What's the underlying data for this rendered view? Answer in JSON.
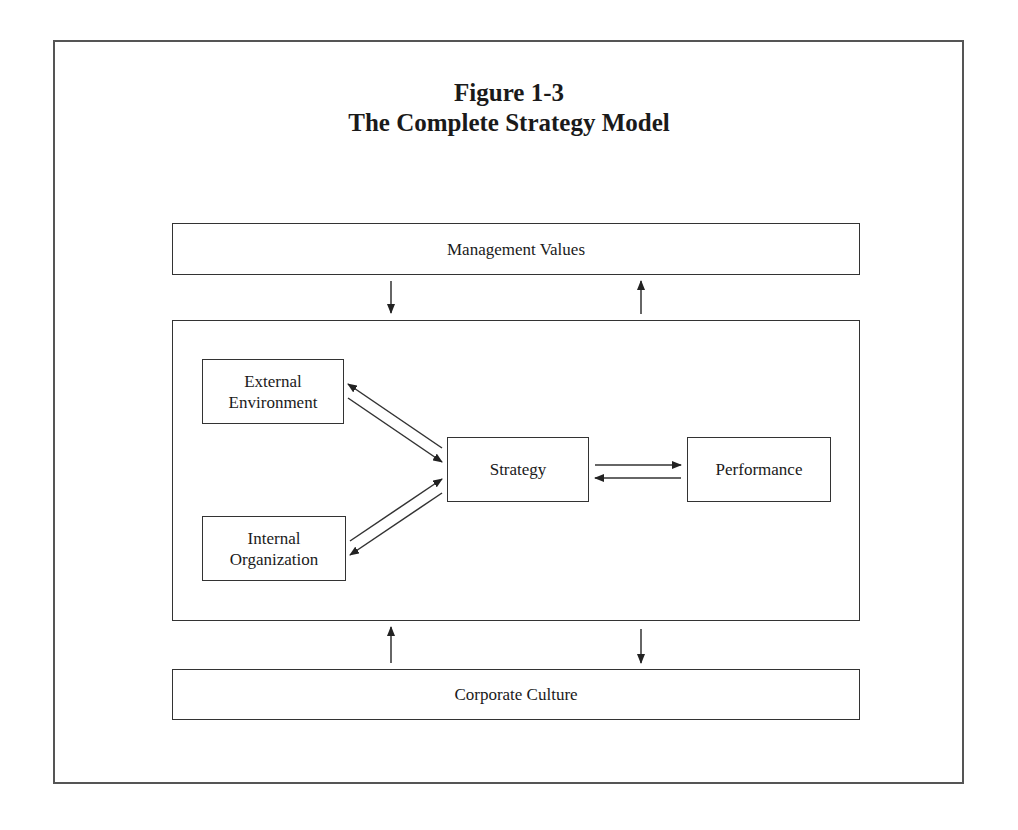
{
  "figure": {
    "number": "Figure 1-3",
    "title": "The Complete Strategy Model"
  },
  "diagram": {
    "outer_bands": {
      "top": "Management Values",
      "bottom": "Corporate Culture"
    },
    "nodes": {
      "external_line1": "External",
      "external_line2": "Environment",
      "internal_line1": "Internal",
      "internal_line2": "Organization",
      "strategy": "Strategy",
      "performance": "Performance"
    },
    "edges": [
      {
        "from": "Management Values",
        "to": "Core Model",
        "direction": "down"
      },
      {
        "from": "Core Model",
        "to": "Management Values",
        "direction": "up"
      },
      {
        "from": "External Environment",
        "to": "Strategy"
      },
      {
        "from": "Strategy",
        "to": "External Environment"
      },
      {
        "from": "Internal Organization",
        "to": "Strategy"
      },
      {
        "from": "Strategy",
        "to": "Internal Organization"
      },
      {
        "from": "Strategy",
        "to": "Performance"
      },
      {
        "from": "Performance",
        "to": "Strategy"
      },
      {
        "from": "Corporate Culture",
        "to": "Core Model",
        "direction": "up"
      },
      {
        "from": "Core Model",
        "to": "Corporate Culture",
        "direction": "down"
      }
    ]
  },
  "colors": {
    "line": "#333333",
    "frame": "#555555",
    "text": "#1a1a1a",
    "background": "#ffffff"
  }
}
